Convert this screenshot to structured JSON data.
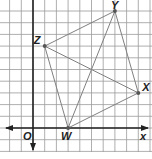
{
  "diagram": {
    "type": "coordinate-plane-quadrilateral",
    "origin_label": "O",
    "x_axis_label": "x",
    "grid_unit_px": 11.7,
    "origin_px": [
      33,
      128
    ],
    "points": [
      {
        "label": "W",
        "x": 3,
        "y": 0
      },
      {
        "label": "X",
        "x": 9,
        "y": 3
      },
      {
        "label": "Y",
        "x": 7,
        "y": 10
      },
      {
        "label": "Z",
        "x": 1,
        "y": 7
      }
    ],
    "segments": [
      [
        "W",
        "X"
      ],
      [
        "X",
        "Y"
      ],
      [
        "Y",
        "Z"
      ],
      [
        "Z",
        "W"
      ],
      [
        "W",
        "Y"
      ],
      [
        "Z",
        "X"
      ]
    ],
    "colors": {
      "grid": "#9a9a9a",
      "axis": "#222222",
      "segment": "#808080",
      "point": "#555555"
    }
  }
}
